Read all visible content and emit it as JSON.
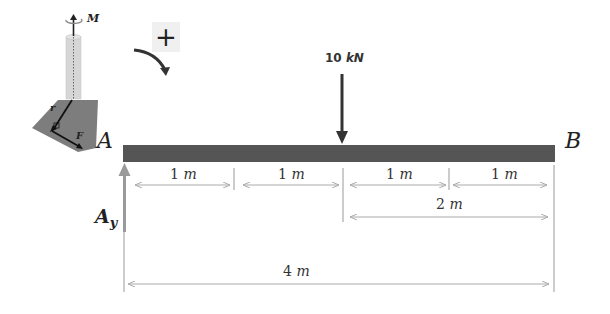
{
  "beam": {
    "left_label": "A",
    "right_label": "B",
    "color": "#555555"
  },
  "load": {
    "label": "10 kN",
    "value": "10",
    "unit": "kN",
    "position_m": 2
  },
  "reaction": {
    "label": "A",
    "subscript": "y",
    "color": "#9a9a9a"
  },
  "sign_convention": {
    "plus": "+",
    "direction": "clockwise"
  },
  "inset": {
    "moment_label": "M",
    "r_label": "r",
    "f_label": "F"
  },
  "dimensions": {
    "segments": [
      {
        "value": "1",
        "unit": "m"
      },
      {
        "value": "1",
        "unit": "m"
      },
      {
        "value": "1",
        "unit": "m"
      },
      {
        "value": "1",
        "unit": "m"
      }
    ],
    "right_half": {
      "value": "2",
      "unit": "m"
    },
    "total": {
      "value": "4",
      "unit": "m"
    }
  }
}
